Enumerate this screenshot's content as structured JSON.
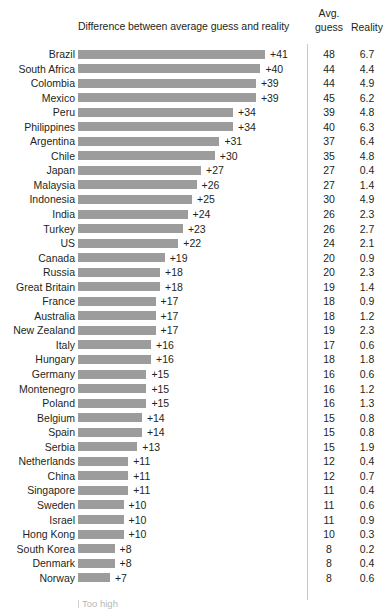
{
  "header": {
    "center_title": "Difference between average guess and reality",
    "avg_line1": "Avg.",
    "avg_line2": "guess",
    "reality": "Reality"
  },
  "footnote": {
    "label": "Too high"
  },
  "colors": {
    "bar": "#9c9c9c",
    "text": "#231f20",
    "divider": "#c9c9c9",
    "footnote": "#b7b7b7"
  },
  "chart_data": {
    "type": "bar",
    "title": "Difference between average guess and reality",
    "xlabel": "",
    "ylabel": "",
    "orientation": "horizontal",
    "grid": false,
    "legend": "none",
    "xlim": [
      0,
      41
    ],
    "value_prefix": "+",
    "columns": [
      "Country",
      "Difference between average guess and reality",
      "Avg. guess",
      "Reality"
    ],
    "categories": [
      "Brazil",
      "South Africa",
      "Colombia",
      "Mexico",
      "Peru",
      "Philippines",
      "Argentina",
      "Chile",
      "Japan",
      "Malaysia",
      "Indonesia",
      "India",
      "Turkey",
      "US",
      "Canada",
      "Russia",
      "Great Britain",
      "France",
      "Australia",
      "New Zealand",
      "Italy",
      "Hungary",
      "Germany",
      "Montenegro",
      "Poland",
      "Belgium",
      "Spain",
      "Serbia",
      "Netherlands",
      "China",
      "Singapore",
      "Sweden",
      "Israel",
      "Hong Kong",
      "South Korea",
      "Denmark",
      "Norway"
    ],
    "values": [
      41,
      40,
      39,
      39,
      34,
      34,
      31,
      30,
      27,
      26,
      25,
      24,
      23,
      22,
      19,
      18,
      18,
      17,
      17,
      17,
      16,
      16,
      15,
      15,
      15,
      14,
      14,
      13,
      11,
      11,
      11,
      10,
      10,
      10,
      8,
      8,
      7
    ],
    "value_labels": [
      "+41",
      "+40",
      "+39",
      "+39",
      "+34",
      "+34",
      "+31",
      "+30",
      "+27",
      "+26",
      "+25",
      "+24",
      "+23",
      "+22",
      "+19",
      "+18",
      "+18",
      "+17",
      "+17",
      "+17",
      "+16",
      "+16",
      "+15",
      "+15",
      "+15",
      "+14",
      "+14",
      "+13",
      "+11",
      "+11",
      "+11",
      "+10",
      "+10",
      "+10",
      "+8",
      "+8",
      "+7"
    ],
    "series": [
      {
        "name": "Avg. guess",
        "values": [
          48,
          44,
          44,
          45,
          39,
          40,
          37,
          35,
          27,
          27,
          30,
          26,
          26,
          24,
          20,
          20,
          19,
          18,
          18,
          19,
          17,
          18,
          16,
          16,
          16,
          15,
          15,
          15,
          12,
          12,
          11,
          11,
          11,
          10,
          8,
          8,
          8
        ]
      },
      {
        "name": "Reality",
        "values": [
          6.7,
          4.4,
          4.9,
          6.2,
          4.8,
          6.3,
          6.4,
          4.8,
          0.4,
          1.4,
          4.9,
          2.3,
          2.7,
          2.1,
          0.9,
          2.3,
          1.4,
          0.9,
          1.2,
          2.3,
          0.6,
          1.8,
          0.6,
          1.2,
          1.3,
          0.8,
          0.8,
          1.9,
          0.4,
          0.7,
          0.4,
          0.6,
          0.9,
          0.3,
          0.2,
          0.4,
          0.6
        ]
      }
    ],
    "guess_labels": [
      "48",
      "44",
      "44",
      "45",
      "39",
      "40",
      "37",
      "35",
      "27",
      "27",
      "30",
      "26",
      "26",
      "24",
      "20",
      "20",
      "19",
      "18",
      "18",
      "19",
      "17",
      "18",
      "16",
      "16",
      "16",
      "15",
      "15",
      "15",
      "12",
      "12",
      "11",
      "11",
      "11",
      "10",
      "8",
      "8",
      "8"
    ],
    "reality_labels": [
      "6.7",
      "4.4",
      "4.9",
      "6.2",
      "4.8",
      "6.3",
      "6.4",
      "4.8",
      "0.4",
      "1.4",
      "4.9",
      "2.3",
      "2.7",
      "2.1",
      "0.9",
      "2.3",
      "1.4",
      "0.9",
      "1.2",
      "2.3",
      "0.6",
      "1.8",
      "0.6",
      "1.2",
      "1.3",
      "0.8",
      "0.8",
      "1.9",
      "0.4",
      "0.7",
      "0.4",
      "0.6",
      "0.9",
      "0.3",
      "0.2",
      "0.4",
      "0.6"
    ],
    "annotations": [
      "Too high"
    ]
  }
}
